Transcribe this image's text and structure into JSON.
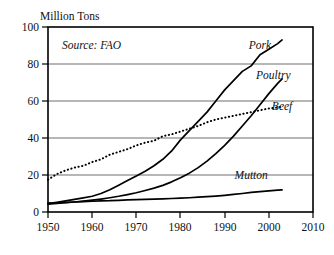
{
  "chart_data": {
    "type": "line",
    "title": "",
    "ylabel": "Million Tons",
    "xlabel": "",
    "source_note": "Source: FAO",
    "xlim": [
      1950,
      2010
    ],
    "ylim": [
      0,
      100
    ],
    "grid": true,
    "legend_position": "inline-labels",
    "x_ticks": [
      "1950",
      "1960",
      "1970",
      "1980",
      "1990",
      "2000",
      "2010"
    ],
    "x_tick_values": [
      1950,
      1960,
      1970,
      1980,
      1990,
      2000,
      2010
    ],
    "y_ticks": [
      "0",
      "20",
      "40",
      "60",
      "80",
      "100"
    ],
    "y_tick_values": [
      0,
      20,
      40,
      60,
      80,
      100
    ],
    "x": [
      1950,
      1952,
      1954,
      1956,
      1958,
      1960,
      1962,
      1964,
      1966,
      1968,
      1970,
      1972,
      1974,
      1976,
      1978,
      1980,
      1982,
      1984,
      1986,
      1988,
      1990,
      1992,
      1994,
      1996,
      1998,
      2000,
      2002,
      2003
    ],
    "series": [
      {
        "name": "Pork",
        "label": "Pork",
        "style": "solid",
        "values": [
          4.5,
          5.2,
          6.0,
          6.8,
          7.6,
          8.5,
          10.0,
          12.0,
          14.5,
          17.0,
          19.5,
          22.0,
          25.0,
          28.5,
          33.0,
          39.0,
          44.0,
          49.0,
          54.0,
          60.0,
          66.0,
          71.0,
          76.0,
          79.0,
          85.0,
          88.0,
          91.0,
          93.0
        ]
      },
      {
        "name": "Poultry",
        "label": "Poultry",
        "style": "solid",
        "values": [
          4.2,
          4.6,
          5.0,
          5.4,
          5.9,
          6.4,
          7.0,
          7.7,
          8.5,
          9.4,
          10.4,
          11.6,
          12.9,
          14.4,
          16.3,
          18.5,
          21.0,
          24.0,
          27.5,
          31.5,
          36.0,
          41.0,
          46.5,
          52.0,
          58.0,
          64.0,
          69.5,
          72.0
        ]
      },
      {
        "name": "Beef",
        "label": "Beef",
        "style": "dotted",
        "values": [
          17.5,
          20.5,
          22.5,
          24.0,
          25.0,
          27.0,
          28.5,
          31.0,
          32.5,
          34.0,
          36.0,
          37.5,
          38.5,
          41.0,
          42.0,
          43.5,
          45.0,
          46.5,
          48.5,
          50.0,
          51.0,
          52.0,
          53.0,
          54.0,
          55.0,
          56.0,
          56.5,
          57.0
        ]
      },
      {
        "name": "Mutton",
        "label": "Mutton",
        "style": "solid",
        "values": [
          4.8,
          5.0,
          5.2,
          5.4,
          5.6,
          5.8,
          6.0,
          6.1,
          6.3,
          6.5,
          6.7,
          6.8,
          7.0,
          7.1,
          7.3,
          7.5,
          7.7,
          8.0,
          8.3,
          8.6,
          9.0,
          9.5,
          10.0,
          10.6,
          11.0,
          11.4,
          11.8,
          12.0
        ]
      }
    ],
    "series_label_positions": [
      {
        "name": "Pork",
        "x": 1998,
        "y": 88
      },
      {
        "name": "Poultry",
        "x": 2001,
        "y": 72
      },
      {
        "name": "Beef",
        "x": 2003,
        "y": 55
      },
      {
        "name": "Mutton",
        "x": 1996,
        "y": 18
      }
    ],
    "colors": {
      "line": "#000000",
      "grid": "#6f6f6f",
      "frame": "#000000",
      "background": "#ffffff",
      "text": "#111111"
    }
  }
}
